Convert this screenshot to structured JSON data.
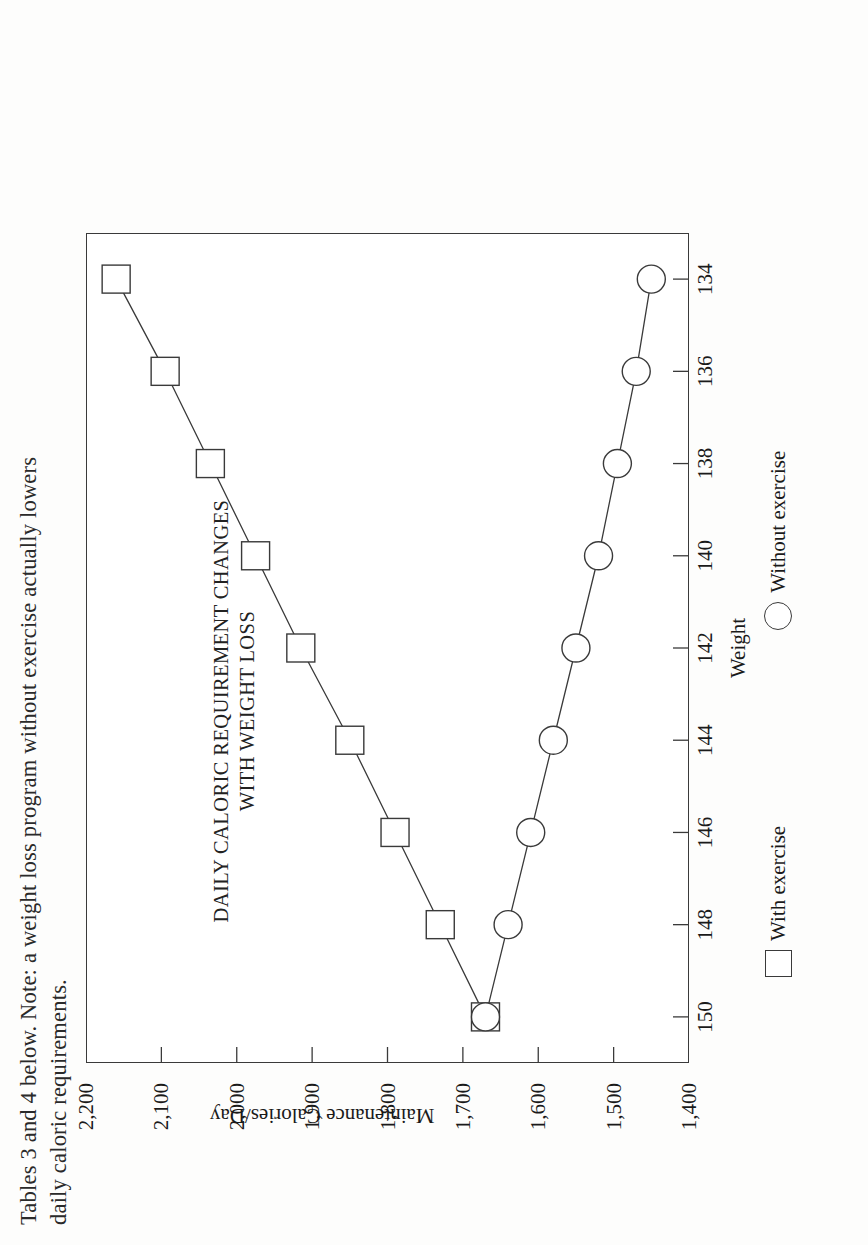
{
  "page": {
    "body_text_line1": "Tables 3 and 4 below.  Note: a weight loss program without exercise actually lowers",
    "body_text_line2": "daily caloric requirements."
  },
  "figure": {
    "title_line1": "DAILY CALORIC REQUIREMENT CHANGES",
    "title_line2": "WITH WEIGHT LOSS",
    "legend": [
      {
        "marker": "square-marker-icon",
        "label": "With exercise"
      },
      {
        "marker": "circle-marker-icon",
        "label": "Without exercise"
      }
    ]
  },
  "chart_data": {
    "type": "line",
    "title": "DAILY CALORIC REQUIREMENT CHANGES WITH WEIGHT LOSS",
    "xlabel": "Weight",
    "ylabel": "Maintenance Calories/Day",
    "x": [
      150,
      148,
      146,
      144,
      142,
      140,
      138,
      136,
      134
    ],
    "xticklabels": [
      "150",
      "148",
      "146",
      "144",
      "142",
      "140",
      "138",
      "136",
      "134"
    ],
    "yticklabels": [
      "1,400",
      "1,500",
      "1,600",
      "1,700",
      "1,800",
      "1,900",
      "2,000",
      "2,100",
      "2,200"
    ],
    "xlim": [
      151,
      133
    ],
    "ylim": [
      1400,
      2200
    ],
    "xaxis_direction": "decreasing",
    "grid": false,
    "legend_position": "below-axis",
    "series": [
      {
        "name": "With exercise",
        "marker": "square",
        "values": [
          1670,
          1730,
          1790,
          1850,
          1915,
          1975,
          2035,
          2095,
          2160
        ]
      },
      {
        "name": "Without exercise",
        "marker": "circle",
        "values": [
          1670,
          1640,
          1610,
          1580,
          1550,
          1520,
          1495,
          1470,
          1450
        ]
      }
    ]
  }
}
